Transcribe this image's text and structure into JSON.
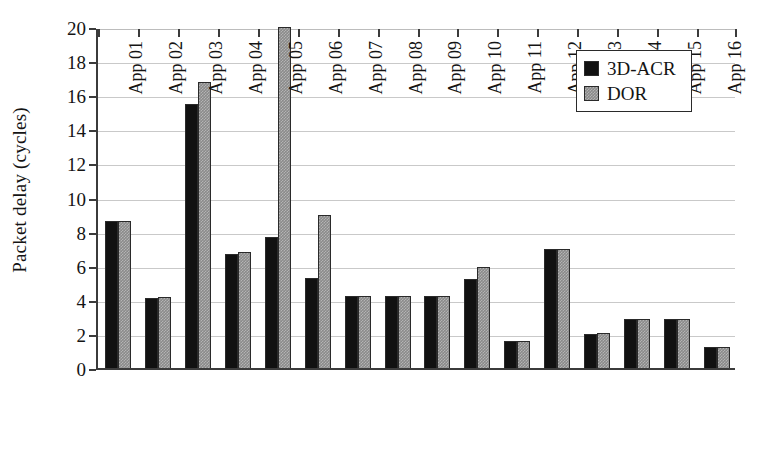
{
  "chart_data": {
    "type": "bar",
    "title": "",
    "xlabel": "",
    "ylabel": "Packet delay (cycles)",
    "ylim": [
      0,
      20
    ],
    "ytick_step": 2,
    "yticks": [
      0,
      2,
      4,
      6,
      8,
      10,
      12,
      14,
      16,
      18,
      20
    ],
    "grid": true,
    "legend_position": "top-right",
    "categories": [
      "App 01",
      "App 02",
      "App 03",
      "App 04",
      "App 05",
      "App 06",
      "App 07",
      "App 08",
      "App 09",
      "App 10",
      "App 11",
      "App 12",
      "App 13",
      "App 14",
      "App 15",
      "App 16"
    ],
    "series": [
      {
        "name": "3D-ACR",
        "color": "#111111",
        "values": [
          8.6,
          4.1,
          15.5,
          6.7,
          7.7,
          5.3,
          4.2,
          4.2,
          4.2,
          5.2,
          1.6,
          7.0,
          2.0,
          2.9,
          2.9,
          1.25
        ]
      },
      {
        "name": "DOR",
        "color": "#8a8a8a",
        "values": [
          8.6,
          4.15,
          16.8,
          6.8,
          20.0,
          9.0,
          4.2,
          4.2,
          4.25,
          5.9,
          1.6,
          7.0,
          2.05,
          2.9,
          2.9,
          1.25
        ]
      }
    ]
  },
  "legend": {
    "items": [
      {
        "label": "3D-ACR"
      },
      {
        "label": "DOR"
      }
    ]
  }
}
